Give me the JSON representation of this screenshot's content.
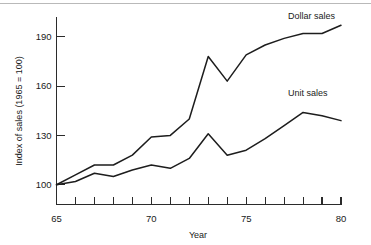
{
  "chart_data": {
    "type": "line",
    "title": "",
    "xlabel": "Year",
    "ylabel": "Index of sales (1965 = 100)",
    "xlim": [
      65,
      80
    ],
    "ylim": [
      88,
      202
    ],
    "grid": false,
    "legend_position": "inline-right",
    "x": [
      65,
      66,
      67,
      68,
      69,
      70,
      71,
      72,
      73,
      74,
      75,
      76,
      77,
      78,
      79,
      80
    ],
    "xticks": [
      65,
      66,
      67,
      68,
      69,
      70,
      71,
      72,
      73,
      74,
      75,
      76,
      77,
      78,
      79,
      80
    ],
    "xtick_labels": [
      "65",
      "",
      "",
      "",
      "",
      "70",
      "",
      "",
      "",
      "",
      "75",
      "",
      "",
      "",
      "",
      "80"
    ],
    "yticks": [
      100,
      130,
      160,
      190
    ],
    "ytick_labels": [
      "100",
      "130",
      "160",
      "190"
    ],
    "series": [
      {
        "name": "Dollar sales",
        "values": [
          100,
          106,
          112,
          112,
          118,
          129,
          130,
          140,
          178,
          163,
          179,
          185,
          189,
          192,
          192,
          197
        ]
      },
      {
        "name": "Unit sales",
        "values": [
          100,
          102,
          107,
          105,
          109,
          112,
          110,
          116,
          131,
          118,
          121,
          128,
          136,
          144,
          142,
          139
        ]
      }
    ],
    "annotations": [
      {
        "text": "Dollar sales",
        "x": 77.2,
        "y": 201
      },
      {
        "text": "Unit sales",
        "x": 77.2,
        "y": 154
      }
    ]
  }
}
